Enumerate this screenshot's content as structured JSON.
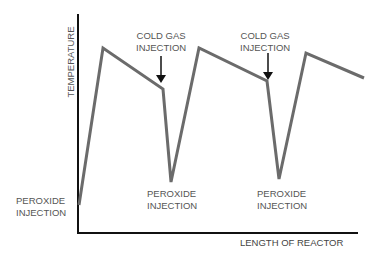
{
  "diagram": {
    "type": "temperature-profile",
    "axes": {
      "y_label": "TEMPERATURE",
      "x_label": "LENGTH OF REACTOR"
    },
    "annotations": {
      "peroxide_injection_1": {
        "line1": "PEROXIDE",
        "line2": "INJECTION"
      },
      "peroxide_injection_2": {
        "line1": "PEROXIDE",
        "line2": "INJECTION"
      },
      "peroxide_injection_3": {
        "line1": "PEROXIDE",
        "line2": "INJECTION"
      },
      "cold_gas_injection_1": {
        "line1": "COLD GAS",
        "line2": "INJECTION"
      },
      "cold_gas_injection_2": {
        "line1": "COLD GAS",
        "line2": "INJECTION"
      }
    },
    "profile_points": [
      [
        79,
        205
      ],
      [
        103,
        48
      ],
      [
        163,
        89
      ],
      [
        171,
        182
      ],
      [
        199,
        48
      ],
      [
        267,
        81
      ],
      [
        279,
        179
      ],
      [
        306,
        53
      ],
      [
        364,
        78
      ]
    ],
    "colors": {
      "axis": "#111111",
      "profile_line": "#6b6b6b",
      "arrow": "#111111",
      "text": "#555555"
    }
  }
}
